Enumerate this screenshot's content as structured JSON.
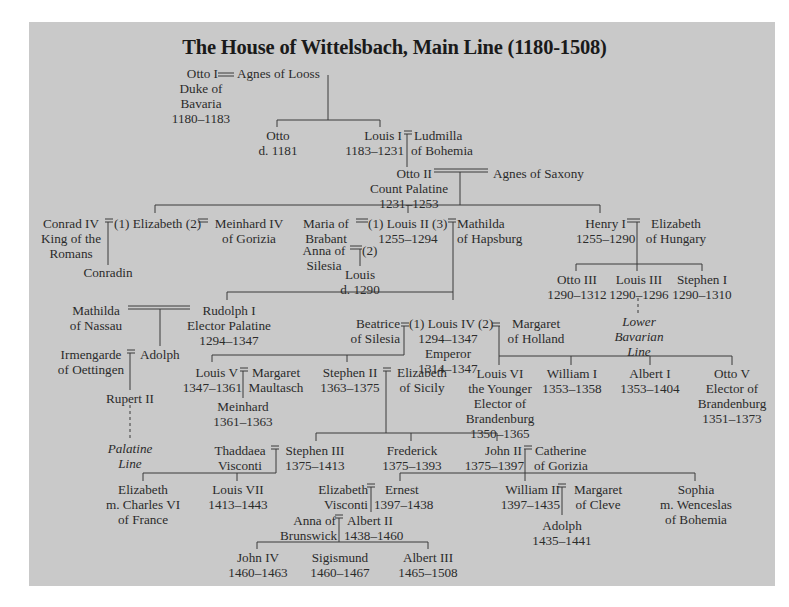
{
  "title": "The House of Wittelsbach, Main Line (1180-1508)",
  "nodes": {
    "otto1": "Otto I",
    "otto1_info": "Duke of\nBavaria\n1180–1183",
    "agnes_looss": "Agnes of Looss",
    "otto_d1181": "Otto\nd. 1181",
    "louis1": "Louis I",
    "louis1_dates": "1183–1231",
    "ludmilla": "Ludmilla",
    "ludmilla_info": "of Bohemia",
    "otto2": "Otto II",
    "otto2_info": "Count Palatine\n1231–1253",
    "agnes_saxony": "Agnes of Saxony",
    "conrad4": "Conrad IV\nKing of the\nRomans",
    "elizabeth": "(1) Elizabeth (2)",
    "meinhard4": "Meinhard IV\nof Gorizia",
    "conradin": "Conradin",
    "maria_brabant": "Maria of\nBrabant",
    "anna_silesia": "Anna of\nSilesia",
    "marker_2": "(2)",
    "louis2": "(1) Louis II (3)",
    "louis2_dates": "1255–1294",
    "mathilda_hapsburg": "Mathilda\nof Hapsburg",
    "louis_d1290": "Louis\nd. 1290",
    "henry1": "Henry I\n1255–1290",
    "elizabeth_hungary": "Elizabeth\nof Hungary",
    "otto3": "Otto III\n1290–1312",
    "louis3": "Louis III\n1290–1296",
    "stephen1": "Stephen I\n1290–1310",
    "lower_bavarian": "Lower\nBavarian\nLine",
    "mathilda_nassau": "Mathilda\nof Nassau",
    "rudolph1": "Rudolph I\nElector Palatine\n1294–1347",
    "beatrice": "Beatrice\nof Silesia",
    "louis4": "(1) Louis IV (2)",
    "louis4_info": "1294–1347\nEmperor\n1314–1347",
    "margaret_holland": "Margaret\nof Holland",
    "irmengarde": "Irmengarde\nof Oettingen",
    "adolph": "Adolph",
    "rupert2": "Rupert II",
    "palatine_line": "Palatine\nLine",
    "louis5": "Louis V",
    "louis5_dates": "1347–1361",
    "margaret_maultasch": "Margaret\nMaultasch",
    "meinhard": "Meinhard\n1361–1363",
    "stephen2": "Stephen II\n1363–1375",
    "elizabeth_sicily": "Elizabeth\nof Sicily",
    "louis6": "Louis VI\nthe Younger\nElector of\nBrandenburg\n1350–1365",
    "william1": "William I\n1353–1358",
    "albert1": "Albert I\n1353–1404",
    "otto5": "Otto V\nElector of\nBrandenburg\n1351–1373",
    "thaddaea": "Thaddaea\nVisconti",
    "stephen3": "Stephen III\n1375–1413",
    "frederick": "Frederick\n1375–1393",
    "john2": "John II",
    "john2_dates": "1375–1397",
    "catherine": "Catherine",
    "catherine_info": "of Gorizia",
    "elizabeth_france": "Elizabeth\nm. Charles VI\nof France",
    "louis7": "Louis VII\n1413–1443",
    "elizabeth_visconti": "Elizabeth\nVisconti",
    "ernest": "Ernest",
    "ernest_dates": "1397–1438",
    "william2": "William II\n1397–1435",
    "margaret_cleve": "Margaret\nof Cleve",
    "sophia": "Sophia\nm. Wenceslas\nof Bohemia",
    "anna_brunswick": "Anna of\nBrunswick",
    "albert2": "Albert II",
    "albert2_dates": "1438–1460",
    "adolph2": "Adolph\n1435–1441",
    "john4": "John IV\n1460–1463",
    "sigismund": "Sigismund\n1460–1467",
    "albert3": "Albert III\n1465–1508"
  }
}
